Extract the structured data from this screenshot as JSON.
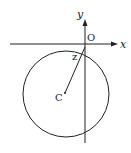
{
  "diagram": {
    "labels": {
      "y_axis": "y",
      "x_axis": "x",
      "origin": "O",
      "point_z": "z",
      "center": "C"
    },
    "colors": {
      "stroke": "#222222",
      "background": "#ffffff"
    }
  }
}
